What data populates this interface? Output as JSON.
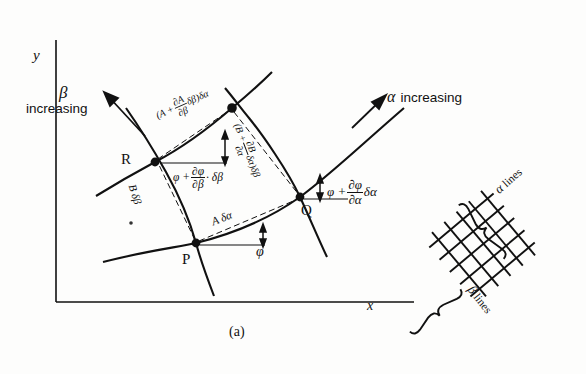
{
  "figure": {
    "caption": "(a)",
    "axes": {
      "x_label": "x",
      "y_label": "y"
    },
    "directions": {
      "alpha_symbol": "α",
      "alpha_word": "increasing",
      "beta_symbol": "β",
      "beta_word": "increasing"
    },
    "vertices": [
      {
        "name": "R",
        "label": "R"
      },
      {
        "name": "P",
        "label": "P"
      },
      {
        "name": "Q",
        "label": "Q"
      }
    ],
    "edge_labels": {
      "top": {
        "prefix": "(A +",
        "num": "∂A",
        "den": "∂β",
        "suffix": "δβ)δα"
      },
      "right": {
        "prefix": "(B +",
        "num": "∂B",
        "den": "∂α",
        "suffix": "δα)δβ"
      },
      "left": "B δβ",
      "bottom": "A δα"
    },
    "angle_labels": {
      "at_R": {
        "prefix": "φ +",
        "num": "∂φ",
        "den": "∂β",
        "suffix": "· δβ"
      },
      "at_Q": {
        "prefix": "φ +",
        "num": "∂φ",
        "den": "∂α",
        "suffix": "δα"
      },
      "at_P": "φ"
    },
    "inset": {
      "alpha_lines_symbol": "α",
      "alpha_lines_word": "lines",
      "beta_lines_symbol": "β",
      "beta_lines_word": "lines"
    },
    "colors": {
      "ink": "#111111",
      "background": "#fdfdfc"
    }
  }
}
